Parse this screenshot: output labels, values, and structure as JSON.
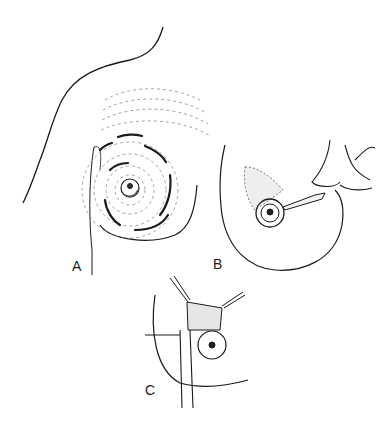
{
  "figure": {
    "type": "medical line illustration",
    "panels": [
      {
        "label": "A",
        "description": "Breast with concentric dashed and solid circular markings around nipple-areola, shoulder outline"
      },
      {
        "label": "B",
        "description": "Breast with periareolar incision being made with scalpel held by hand; dotted shaded area above areola"
      },
      {
        "label": "C",
        "description": "Retractors exposing tissue above areola with instrument inserted"
      }
    ]
  },
  "labels": {
    "a": "A",
    "b": "B",
    "c": "C"
  },
  "colors": {
    "line": "#1a1a1a",
    "dash": "#888888",
    "background": "#ffffff"
  }
}
